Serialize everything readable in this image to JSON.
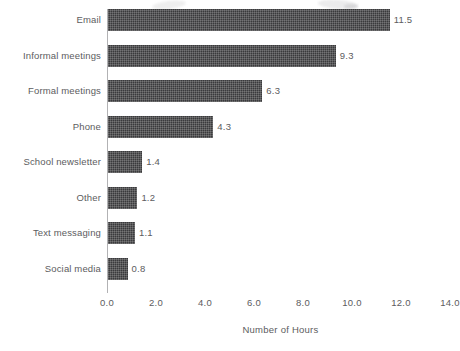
{
  "chart_data": {
    "type": "bar",
    "orientation": "horizontal",
    "title": "",
    "subtitle": "",
    "xlabel": "Number of Hours",
    "ylabel": "",
    "categories": [
      "Email",
      "Informal meetings",
      "Formal meetings",
      "Phone",
      "School newsletter",
      "Other",
      "Text messaging",
      "Social media"
    ],
    "values": [
      11.5,
      9.3,
      6.3,
      4.3,
      1.4,
      1.2,
      1.1,
      0.8
    ],
    "value_labels": [
      "11.5",
      "9.3",
      "6.3",
      "4.3",
      "1.4",
      "1.2",
      "1.1",
      "0.8"
    ],
    "xlim": [
      0.0,
      14.0
    ],
    "xticks": [
      0.0,
      2.0,
      4.0,
      6.0,
      8.0,
      10.0,
      12.0,
      14.0
    ],
    "xtick_labels": [
      "0.0",
      "2.0",
      "4.0",
      "6.0",
      "8.0",
      "10.0",
      "12.0",
      "14.0"
    ],
    "grid": false,
    "legend": null,
    "legend_position": "none",
    "bar_color": "#3a3a3c",
    "bar_pattern": "dithered-halftone",
    "axis_color": "#b2b2b4",
    "text_color": "#5c5c5e",
    "background_color": "#ffffff"
  },
  "figure": {
    "axis_origin_x_px": 107,
    "pixels_per_unit": 24.5,
    "bar_height_px": 22,
    "row_pitch_px": 35.5
  }
}
